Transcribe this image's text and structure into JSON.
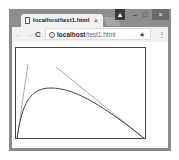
{
  "browser": {
    "tab": {
      "title": "localhost/test1.html",
      "close_glyph": "×"
    },
    "window_controls": {
      "user_glyph": "▲",
      "minimize_glyph": "–",
      "maximize_glyph": "□",
      "close_glyph": "×"
    },
    "toolbar": {
      "back_glyph": "←",
      "forward_glyph": "→",
      "reload_glyph": "C",
      "menu_glyph": "⋮"
    },
    "address": {
      "host": "localhost",
      "path": "/test1.html",
      "info_glyph": "i",
      "star_glyph": "★"
    }
  },
  "page": {
    "content": "canvas drawing: curve with two tangent lines",
    "colors": {
      "curve": "#444444",
      "tangent": "#aaaaaa"
    }
  }
}
